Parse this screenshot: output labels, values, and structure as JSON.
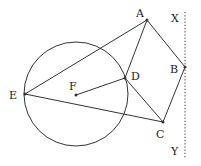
{
  "diagram": {
    "stroke_color": "#333333",
    "circle": {
      "cx": 76,
      "cy": 94,
      "r": 52
    },
    "points": {
      "A": {
        "x": 147,
        "y": 20,
        "label": "A",
        "lx": 136,
        "ly": 17
      },
      "B": {
        "x": 185,
        "y": 67,
        "label": "B",
        "lx": 170,
        "ly": 73
      },
      "C": {
        "x": 163,
        "y": 122,
        "label": "C",
        "lx": 156,
        "ly": 138
      },
      "D": {
        "x": 125,
        "y": 78,
        "label": "D",
        "lx": 131,
        "ly": 80
      },
      "E": {
        "x": 25,
        "y": 94,
        "label": "E",
        "lx": 9,
        "ly": 99
      },
      "F": {
        "x": 76,
        "y": 95,
        "label": "F",
        "lx": 69,
        "ly": 90
      }
    },
    "segments": [
      [
        "E",
        "A"
      ],
      [
        "E",
        "C"
      ],
      [
        "A",
        "B"
      ],
      [
        "B",
        "C"
      ],
      [
        "A",
        "D"
      ],
      [
        "D",
        "C"
      ],
      [
        "F",
        "D"
      ]
    ],
    "dotted_line": {
      "x": 185,
      "y1": 12,
      "y2": 158,
      "top_label": "X",
      "top_lx": 171,
      "top_ly": 22,
      "bottom_label": "Y",
      "bottom_lx": 171,
      "bottom_ly": 155
    }
  }
}
